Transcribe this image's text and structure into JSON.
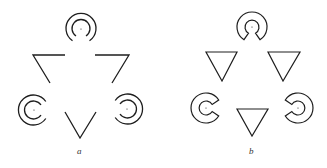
{
  "figure": {
    "panels": [
      {
        "id": "a",
        "label": "a",
        "description": "Line-drawing illusory triangle with concentric arc inducers",
        "inducers": [
          {
            "position": "top",
            "cx": 81,
            "cy": 29,
            "r_outer": 15,
            "r_inner": 9,
            "opening": "bottom"
          },
          {
            "position": "left",
            "cx": 34,
            "cy": 110,
            "r_outer": 15,
            "r_inner": 9,
            "opening": "right"
          },
          {
            "position": "right",
            "cx": 127,
            "cy": 109,
            "r_outer": 15,
            "r_inner": 9,
            "opening": "left"
          }
        ],
        "line_segments": [
          {
            "name": "upper-left-corner",
            "points": [
              [
                65,
                55
              ],
              [
                33,
                55
              ],
              [
                50,
                83
              ]
            ]
          },
          {
            "name": "upper-right-corner",
            "points": [
              [
                95,
                55
              ],
              [
                129,
                55
              ],
              [
                112,
                83
              ]
            ]
          },
          {
            "name": "lower-v",
            "points": [
              [
                65,
                112
              ],
              [
                80,
                138
              ],
              [
                96,
                112
              ]
            ]
          }
        ]
      },
      {
        "id": "b",
        "label": "b",
        "description": "Illusory triangle with pac-man inducers and solid outlined triangles",
        "inducers": [
          {
            "position": "top",
            "cx": 252,
            "cy": 27,
            "r_outer": 15,
            "r_inner": 7,
            "opening": "bottom"
          },
          {
            "position": "left",
            "cx": 206,
            "cy": 108,
            "r_outer": 15,
            "r_inner": 7,
            "opening": "right"
          },
          {
            "position": "right",
            "cx": 298,
            "cy": 108,
            "r_outer": 15,
            "r_inner": 7,
            "opening": "left"
          }
        ],
        "triangles": [
          {
            "name": "left",
            "points": [
              [
                206,
                52
              ],
              [
                237,
                52
              ],
              [
                222,
                81
              ]
            ]
          },
          {
            "name": "right",
            "points": [
              [
                268,
                52
              ],
              [
                300,
                52
              ],
              [
                283,
                81
              ]
            ]
          },
          {
            "name": "bottom",
            "points": [
              [
                237,
                109
              ],
              [
                268,
                109
              ],
              [
                252,
                136
              ]
            ]
          }
        ]
      }
    ],
    "colors": {
      "line": "#1e1e1e",
      "background": "#ffffff",
      "label": "#333333"
    }
  }
}
